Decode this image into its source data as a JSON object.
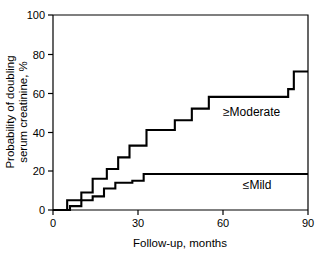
{
  "chart_data": {
    "type": "line",
    "subtype": "kaplan-meier-step",
    "title": "",
    "xlabel": "Follow-up, months",
    "ylabel": "Probability of doubling serum creatinine, %",
    "ylabel_lines": [
      "Probability of doubling",
      "serum creatinine, %"
    ],
    "xlim": [
      0,
      90
    ],
    "ylim": [
      0,
      100
    ],
    "xticks": [
      0,
      30,
      60,
      90
    ],
    "xtick_labels": [
      "0",
      "30",
      "60",
      "90"
    ],
    "yticks": [
      0,
      20,
      40,
      60,
      80,
      100
    ],
    "ytick_labels": [
      "0",
      "20",
      "40",
      "60",
      "80",
      "100"
    ],
    "grid": false,
    "legend": "inline-annotation",
    "line_color": "#000000",
    "background_color": "#ffffff",
    "series": [
      {
        "name": "≥Moderate",
        "label": "≥Moderate",
        "label_x": 60,
        "label_y": 48,
        "step": "post",
        "x": [
          0,
          4,
          5,
          8,
          10,
          13,
          14,
          16,
          19,
          21,
          23,
          25,
          27,
          30,
          33,
          36,
          41,
          43,
          47,
          49,
          52,
          55,
          81,
          83,
          85,
          90
        ],
        "y": [
          0,
          0,
          5,
          5,
          9,
          9,
          16,
          16,
          21,
          21,
          27,
          27,
          33,
          33,
          41,
          41,
          41,
          46,
          46,
          52,
          52,
          58,
          58,
          62,
          71,
          71
        ]
      },
      {
        "name": "≤Mild",
        "label": "≤Mild",
        "label_x": 67,
        "label_y": 11,
        "step": "post",
        "x": [
          0,
          4,
          6,
          8,
          10,
          12,
          14,
          16,
          18,
          20,
          22,
          25,
          28,
          30,
          32,
          90
        ],
        "y": [
          0,
          0,
          2,
          2,
          5,
          5,
          7,
          7,
          11,
          11,
          14,
          14,
          15,
          15,
          18.5,
          18.5
        ]
      }
    ]
  },
  "figure": {
    "axis_label_x": "Follow-up, months",
    "axis_label_y_line1": "Probability of doubling",
    "axis_label_y_line2": "serum creatinine, %",
    "series_label_moderate": "≥Moderate",
    "series_label_mild": "≤Mild",
    "xtick_0": "0",
    "xtick_1": "30",
    "xtick_2": "60",
    "xtick_3": "90",
    "ytick_0": "0",
    "ytick_1": "20",
    "ytick_2": "40",
    "ytick_3": "60",
    "ytick_4": "80",
    "ytick_5": "100"
  }
}
